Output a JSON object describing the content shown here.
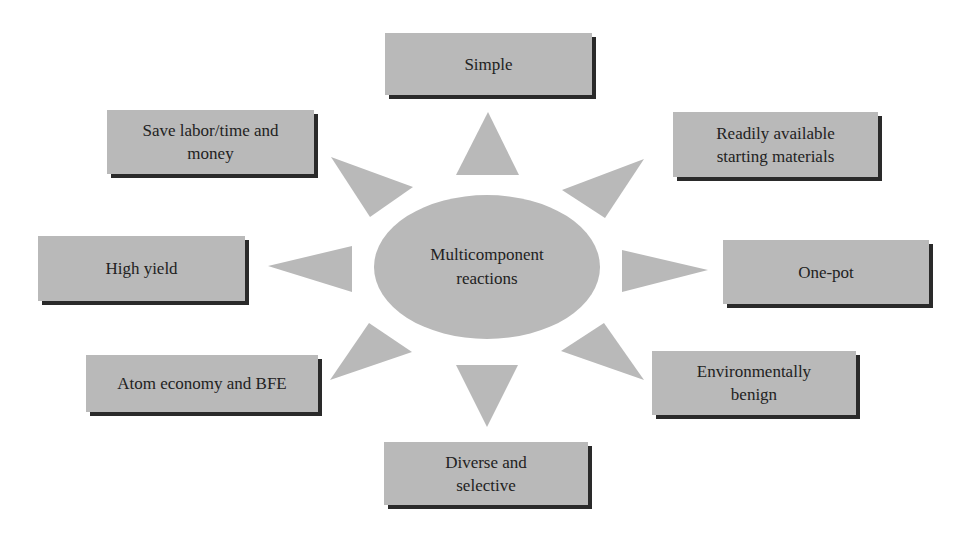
{
  "diagram": {
    "type": "radial concept diagram",
    "center": {
      "label_line1": "Multicomponent",
      "label_line2": "reactions",
      "shape": "ellipse"
    },
    "nodes": [
      {
        "id": "simple",
        "line1": "Simple",
        "line2": "",
        "position": "top"
      },
      {
        "id": "readily-available",
        "line1": "Readily available",
        "line2": "starting materials",
        "position": "top-right"
      },
      {
        "id": "one-pot",
        "line1": "One-pot",
        "line2": "",
        "position": "right"
      },
      {
        "id": "environmentally-benign",
        "line1": "Environmentally",
        "line2": "benign",
        "position": "bottom-right"
      },
      {
        "id": "diverse-selective",
        "line1": "Diverse and",
        "line2": "selective",
        "position": "bottom"
      },
      {
        "id": "atom-economy",
        "line1": "Atom economy and BFE",
        "line2": "",
        "position": "bottom-left"
      },
      {
        "id": "high-yield",
        "line1": "High yield",
        "line2": "",
        "position": "left"
      },
      {
        "id": "save-labor",
        "line1": "Save labor/time and",
        "line2": "money",
        "position": "top-left"
      }
    ],
    "arrow_count": 8,
    "colors": {
      "fill": "#b9b9b9",
      "shadow": "#2a2a2a",
      "text": "#222222",
      "background": "#ffffff"
    }
  }
}
